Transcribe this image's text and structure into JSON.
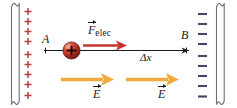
{
  "figure": {
    "type": "physics-diagram",
    "background_color": "#ffffff"
  },
  "plates": {
    "left": {
      "name": "positive-plate",
      "charge_symbol": "+",
      "charge_count": 9,
      "charge_color": "#b5403a",
      "outline_color": "#6b6f76",
      "fill_color": "#ffffff"
    },
    "right": {
      "name": "negative-plate",
      "charge_symbol": "–",
      "charge_count": 9,
      "charge_color": "#3e4a63",
      "outline_color": "#6b6f76",
      "fill_color": "#ffffff"
    }
  },
  "particle": {
    "name": "positive-charge",
    "symbol": "+",
    "fill_highlight": "#e8746a",
    "fill_mid": "#c0392f",
    "fill_edge": "#6d1b14",
    "symbol_color": "#2b0906"
  },
  "labels": {
    "point_a": "A",
    "point_b": "B",
    "displacement": "Δx",
    "force_symbol": "F",
    "force_subscript": "elec",
    "field_symbol": "E"
  },
  "vectors": {
    "force": {
      "name": "electric-force-arrow",
      "color": "#c5352c",
      "direction": "right",
      "label": "F_elec"
    },
    "field_left": {
      "name": "electric-field-arrow-left",
      "color": "#f0a93c",
      "direction": "right",
      "label": "E"
    },
    "field_right": {
      "name": "electric-field-arrow-right",
      "color": "#f0a93c",
      "direction": "right",
      "label": "E"
    },
    "displacement": {
      "name": "displacement-arrow",
      "color": "#1a1a1a",
      "direction": "right",
      "label": "Δx"
    }
  },
  "colors": {
    "line": "#1a1a1a",
    "plate_outline": "#6b6f76",
    "positive_charge": "#b5403a",
    "negative_charge": "#3e4a63",
    "force_arrow": "#c5352c",
    "field_arrow": "#f0a93c"
  }
}
